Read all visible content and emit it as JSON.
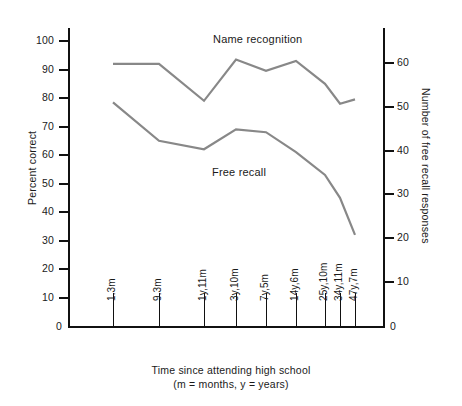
{
  "chart_data": {
    "type": "line",
    "title": "",
    "xlabel": "Time since attending high school (m = months, y = years)",
    "xlabel_line1": "Time since attending high school",
    "xlabel_line2": "(m = months, y = years)",
    "ylabel": "Percent correct",
    "ylabel_right": "Number of free recall responses",
    "categories": [
      "1.3m",
      "9.3m",
      "1y,11m",
      "3y,10m",
      "7y,5m",
      "14y,6m",
      "25y,10m",
      "34y,11m",
      "47y,7m"
    ],
    "ylim": [
      0,
      100
    ],
    "yticks": [
      0,
      10,
      20,
      30,
      40,
      50,
      60,
      70,
      80,
      90,
      100
    ],
    "ylim_right": [
      0,
      65
    ],
    "yticks_right": [
      0,
      10,
      20,
      30,
      40,
      50,
      60
    ],
    "grid": false,
    "legend": "inline-annotations",
    "series": [
      {
        "name": "Name recognition",
        "values": [
          92,
          92,
          79,
          93.5,
          89.5,
          93,
          85,
          78,
          79.5
        ],
        "color": "#888888"
      },
      {
        "name": "Free recall",
        "values": [
          78.5,
          65,
          62,
          69,
          68,
          61,
          53,
          45,
          32
        ],
        "color": "#888888"
      }
    ],
    "annotations": [
      {
        "text": "Name recognition",
        "x": 0.42,
        "y": 97
      },
      {
        "text": "Free recall",
        "x": 0.38,
        "y": 54
      }
    ]
  },
  "axis": {
    "zero_left": "0",
    "zero_right": "0"
  }
}
